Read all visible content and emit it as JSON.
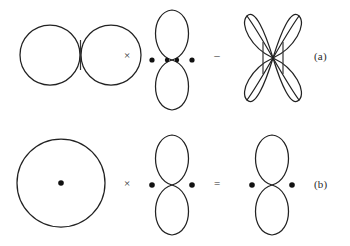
{
  "figure": {
    "title": "",
    "background_color": "#ffffff",
    "stroke_color": "#222222",
    "dot_color": "#111111",
    "rows": [
      {
        "id": "row-a",
        "label": "(a)",
        "terms": [
          {
            "name": "two-tangent-circles",
            "shape": "two-circles",
            "dots": 0,
            "ticks": 1
          },
          {
            "name": "figure-eight-four-dots",
            "shape": "figure-eight",
            "dots": 4,
            "ticks": 0
          },
          {
            "name": "four-petal-rosette",
            "shape": "rosette",
            "petals": 4,
            "dots": 0,
            "ticks": 2
          }
        ],
        "operators": [
          "×",
          "–"
        ]
      },
      {
        "id": "row-b",
        "label": "(b)",
        "terms": [
          {
            "name": "circle-with-center-dot",
            "shape": "circle",
            "dots": 1,
            "ticks": 0
          },
          {
            "name": "figure-eight-two-dots-left",
            "shape": "figure-eight",
            "dots": 2,
            "ticks": 0
          },
          {
            "name": "figure-eight-two-dots-right",
            "shape": "figure-eight",
            "dots": 2,
            "ticks": 0
          }
        ],
        "operators": [
          "×",
          "="
        ]
      }
    ]
  }
}
